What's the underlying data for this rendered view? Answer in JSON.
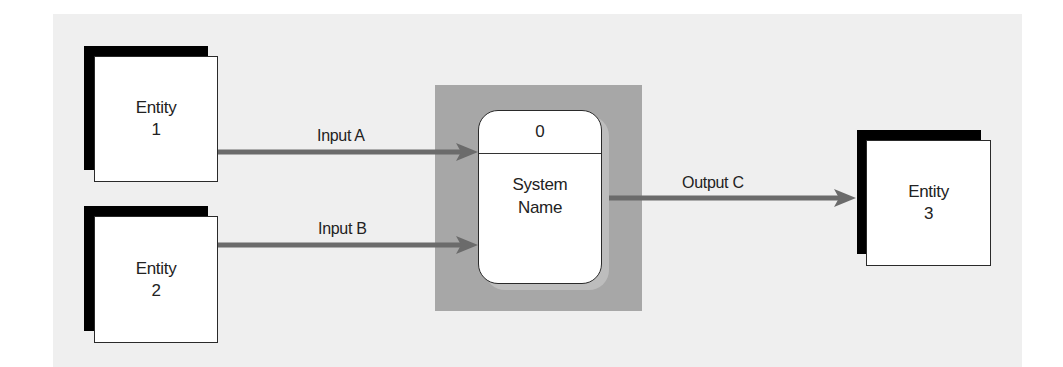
{
  "diagram": {
    "type": "context-diagram",
    "colors": {
      "background": "#efefef",
      "process_backdrop": "#a7a7a7",
      "process_shadow": "#bdbdbd",
      "arrow": "#6b6b6b",
      "entity_shadow": "#000000"
    },
    "entities": [
      {
        "id": "entity-1",
        "line1": "Entity",
        "line2": "1"
      },
      {
        "id": "entity-2",
        "line1": "Entity",
        "line2": "2"
      },
      {
        "id": "entity-3",
        "line1": "Entity",
        "line2": "3"
      }
    ],
    "process": {
      "number": "0",
      "name_line1": "System",
      "name_line2": "Name"
    },
    "flows": [
      {
        "label": "Input A",
        "from": "Entity 1",
        "to": "System Name"
      },
      {
        "label": "Input B",
        "from": "Entity 2",
        "to": "System Name"
      },
      {
        "label": "Output C",
        "from": "System Name",
        "to": "Entity 3"
      }
    ]
  }
}
